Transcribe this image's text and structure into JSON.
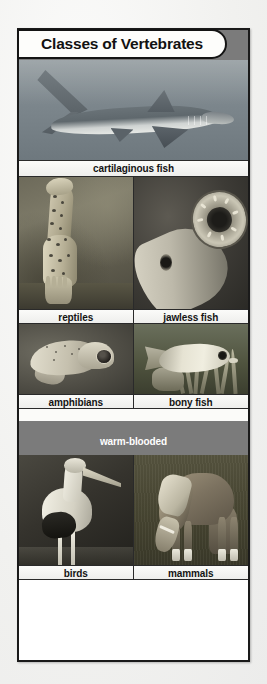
{
  "poster": {
    "title": "Classes of Vertebrates",
    "sections": [
      {
        "id": "cold-blooded",
        "heading": "Cold-blooded",
        "rows": [
          {
            "layout": "full",
            "cells": [
              {
                "caption": "cartilaginous fish",
                "subject": "shark swimming in open water"
              }
            ]
          },
          {
            "layout": "split",
            "cells": [
              {
                "caption": "reptiles",
                "subject": "spotted gecko lizard on ground"
              },
              {
                "caption": "jawless fish",
                "subject": "lamprey showing circular sucker mouth"
              }
            ]
          },
          {
            "layout": "split",
            "cells": [
              {
                "caption": "amphibians",
                "subject": "pale tree frog perched"
              },
              {
                "caption": "bony fish",
                "subject": "pale bony fish among sea anemone"
              }
            ]
          }
        ]
      },
      {
        "id": "warm-blooded",
        "heading": "warm-blooded",
        "rows": [
          {
            "layout": "split",
            "cells": [
              {
                "caption": "birds",
                "subject": "wood stork wading in shallow water"
              },
              {
                "caption": "mammals",
                "subject": "horse grazing in a grassy field"
              }
            ]
          }
        ]
      }
    ]
  },
  "colors": {
    "page_background": "#f1f1ef",
    "poster_background": "#ffffff",
    "frame_border": "#1a1a1a",
    "section_band": "#7b7b7b",
    "section_band_text": "#ffffff",
    "caption_background": "#f4f4f2",
    "caption_text": "#141414",
    "title_background": "#fdfdfb",
    "title_text": "#121212"
  }
}
